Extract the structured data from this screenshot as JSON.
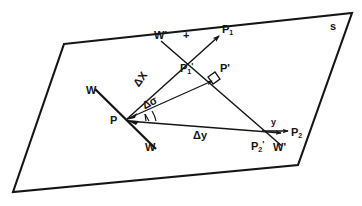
{
  "figure": {
    "title": "",
    "surface_label": "s",
    "colors": {
      "ink": "#151515",
      "background": "#ffffff"
    },
    "labels": {
      "surface": "s",
      "w_upper_left": "W",
      "w_lower_right": "W",
      "w_prime_top": "W'",
      "w_prime_bottom": "W'",
      "plus_marker": "+",
      "point_p": "P",
      "point_p_prime": "P'",
      "point_p1": "P",
      "point_p1_sub": "1",
      "point_p1_prime": "P",
      "point_p1_prime_sub": "1",
      "point_p2": "P",
      "point_p2_sub": "2",
      "point_p2_prime": "P",
      "point_p2_prime_sub": "2",
      "axis_y": "y",
      "delta_x": "ΔX",
      "delta_sigma": "Δσ",
      "delta_y": "Δy"
    },
    "geometry": {
      "parallelogram": "64,44 352,13 298,165 13,192",
      "point_P": [
        126,
        120
      ],
      "point_P1_arrowtip": [
        221,
        34
      ],
      "point_P2_arrowtip": [
        283,
        131
      ],
      "point_Pprime": [
        216,
        79
      ],
      "w_line_start": [
        95,
        89
      ],
      "w_line_end": [
        155,
        148
      ],
      "wprime_line_start": [
        160,
        40
      ],
      "wprime_line_end": [
        281,
        145
      ]
    }
  }
}
